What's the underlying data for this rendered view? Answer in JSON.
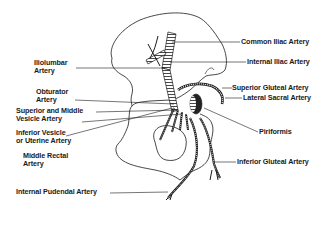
{
  "diagram": {
    "colors": {
      "line": "#1a1a1a",
      "bone_fill": "#ffffff",
      "muscle": "#222222"
    },
    "labels_left": [
      {
        "id": "iliolumbar",
        "line1": "Iliolumbar",
        "line2": "Artery"
      },
      {
        "id": "obturator",
        "line1": "Obturator",
        "line2": "Artery"
      },
      {
        "id": "superior-middle-vesicle",
        "line1": "Superior and Middle",
        "line2": "Vesicle Artery"
      },
      {
        "id": "inferior-vesicle",
        "line1": "Inferior Vesicle",
        "line2": "or Uterine Artery"
      },
      {
        "id": "middle-rectal",
        "line1": "Middle Rectal",
        "line2": "Artery"
      },
      {
        "id": "internal-pudendal",
        "line1": "Internal Pudendal Artery"
      }
    ],
    "labels_right": [
      {
        "id": "common-iliac",
        "line1": "Common Iliac Artery"
      },
      {
        "id": "internal-iliac",
        "line1": "Internal Iliac Artery"
      },
      {
        "id": "superior-gluteal",
        "line1": "Superior Gluteal Artery"
      },
      {
        "id": "lateral-sacral",
        "line1": "Lateral Sacral Artery"
      },
      {
        "id": "piriformis",
        "line1": "Piriformis"
      },
      {
        "id": "inferior-gluteal",
        "line1": "Inferior Gluteal Artery"
      }
    ]
  }
}
